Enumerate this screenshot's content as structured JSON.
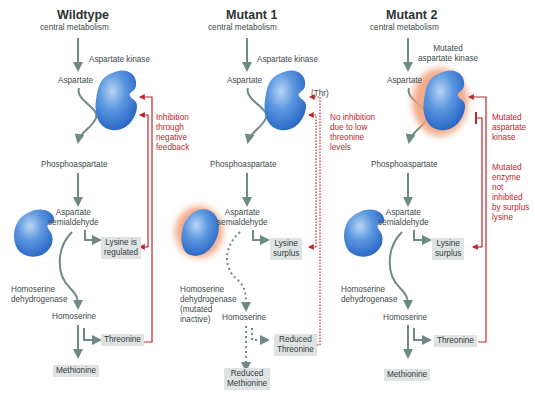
{
  "colors": {
    "arrow": "#6f8a86",
    "inhibition": "#c0262d",
    "enzyme": "#3d7ed6",
    "mutated_glow": "#f3a27e",
    "product_box": "#dfe3e3"
  },
  "panels": [
    {
      "title": "Wildtype",
      "source": "central metabolism",
      "enzyme1": "Aspartate kinase",
      "aspartate": "Aspartate",
      "feedback_note": [
        "Inhibition",
        "through",
        "negative",
        "feedback"
      ],
      "phospho": "Phosphoaspartate",
      "semi": [
        "Aspartate",
        "semialdehyde"
      ],
      "lysine": [
        "Lysine is",
        "regulated"
      ],
      "enzyme2": [
        "Homoserine",
        "dehydrogenase"
      ],
      "homoserine": "Homoserine",
      "threonine": "Threonine",
      "methionine": "Methionine"
    },
    {
      "title": "Mutant 1",
      "source": "central metabolism",
      "enzyme1": "Aspartate kinase",
      "aspartate": "Aspartate",
      "thr_label": "(Thr)",
      "feedback_note": [
        "No inhibition",
        "due to low",
        "threonine",
        "levels"
      ],
      "phospho": "Phosphoaspartate",
      "semi": [
        "Aspartate",
        "semialdehyde"
      ],
      "lysine": [
        "Lysine",
        "surplus"
      ],
      "enzyme2": [
        "Homoserine",
        "dehydrogenase",
        "(mutated",
        "inactive)"
      ],
      "homoserine": "Homoserine",
      "threonine": [
        "Reduced",
        "Threonine"
      ],
      "methionine": [
        "Reduced",
        "Methionine"
      ]
    },
    {
      "title": "Mutant 2",
      "source": "central metabolism",
      "enzyme1": [
        "Mutated",
        "aspartate kinase"
      ],
      "aspartate": "Aspartate",
      "feedback_note_1": [
        "Mutated",
        "aspartate",
        "kinase"
      ],
      "feedback_note_2": [
        "Mutated",
        "enzyme",
        "not",
        "inhibited",
        "by surplus",
        "lysine"
      ],
      "phospho": "Phosphoaspartate",
      "semi": [
        "Aspartate",
        "semialdehyde"
      ],
      "lysine": [
        "Lysine",
        "surplus"
      ],
      "enzyme2": [
        "Homoserine",
        "dehydrogenase"
      ],
      "homoserine": "Homoserine",
      "threonine": "Threonine",
      "methionine": "Methionine"
    }
  ]
}
